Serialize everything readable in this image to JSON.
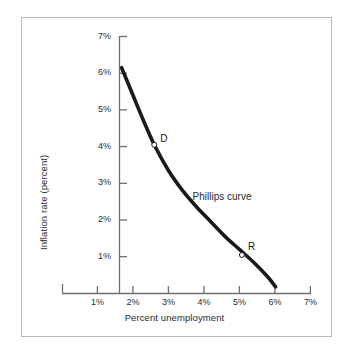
{
  "chart_data": {
    "type": "line",
    "title": "",
    "xlabel": "Percent unemployment",
    "ylabel": "Inflation rate (percent)",
    "xlim": [
      0,
      7
    ],
    "ylim": [
      0,
      7
    ],
    "grid": false,
    "legend": null,
    "x_ticks": [
      {
        "value": 1,
        "label": "1%"
      },
      {
        "value": 2,
        "label": "2%"
      },
      {
        "value": 3,
        "label": "3%"
      },
      {
        "value": 4,
        "label": "4%"
      },
      {
        "value": 5,
        "label": "5%"
      },
      {
        "value": 6,
        "label": "6%"
      },
      {
        "value": 7,
        "label": "7%"
      }
    ],
    "y_ticks": [
      {
        "value": 1,
        "label": "1%"
      },
      {
        "value": 2,
        "label": "2%"
      },
      {
        "value": 3,
        "label": "3%"
      },
      {
        "value": 4,
        "label": "4%"
      },
      {
        "value": 5,
        "label": "5%"
      },
      {
        "value": 6,
        "label": "6%"
      },
      {
        "value": 7,
        "label": "7%"
      }
    ],
    "series": [
      {
        "name": "Phillips curve",
        "color": "#1a1a1a",
        "x": [
          1.68,
          2.0,
          2.3,
          2.6,
          3.0,
          3.4,
          3.8,
          4.2,
          4.6,
          5.0,
          5.4,
          5.8,
          6.02
        ],
        "y": [
          6.15,
          5.4,
          4.7,
          4.05,
          3.35,
          2.8,
          2.35,
          1.95,
          1.55,
          1.2,
          0.85,
          0.45,
          0.18
        ]
      }
    ],
    "annotations": [
      {
        "text": "Phillips curve",
        "x": 3.68,
        "y": 2.62
      }
    ],
    "points": [
      {
        "label": "D",
        "x": 2.6,
        "y": 4.05,
        "marker": "open-circle"
      },
      {
        "label": "R",
        "x": 5.07,
        "y": 1.05,
        "marker": "open-circle"
      }
    ]
  },
  "axes": {
    "x_title": "Percent unemployment",
    "y_title": "Inflation rate (percent)"
  },
  "colors": {
    "curve": "#1a1a1a",
    "axis": "#6f6f6f",
    "frame": "#b9b9b9",
    "text": "#2b2b2b",
    "background": "#ffffff"
  }
}
